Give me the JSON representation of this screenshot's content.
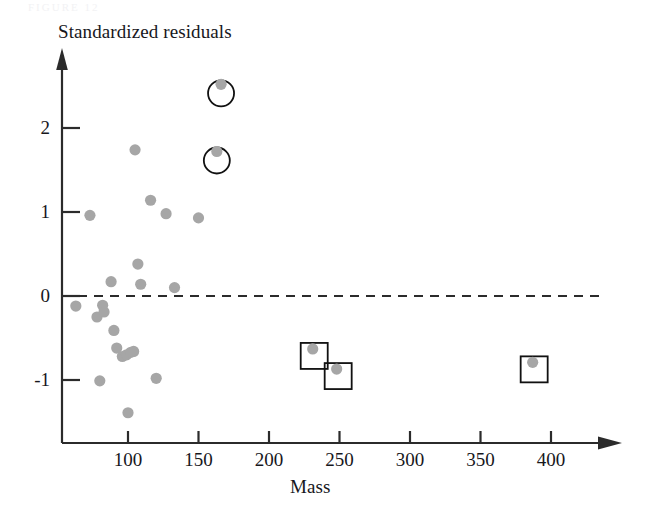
{
  "figure": {
    "ghost_header": "FIGURE 12",
    "y_axis_title": "Standardized residuals",
    "x_axis_title": "Mass"
  },
  "colors": {
    "point_fill": "#a6a6a6",
    "axis": "#2b2b2b",
    "marker_outline": "#111111",
    "text": "#17171c",
    "background": "#ffffff"
  },
  "chart_data": {
    "type": "scatter",
    "title": "",
    "xlabel": "Mass",
    "ylabel": "Standardized residuals",
    "xlim": [
      55,
      420
    ],
    "ylim": [
      -1.55,
      2.85
    ],
    "grid": false,
    "legend": false,
    "reference_line": {
      "orientation": "horizontal",
      "y": 0,
      "style": "dashed"
    },
    "xticks": [
      100,
      150,
      200,
      250,
      300,
      350,
      400
    ],
    "xticklabels": [
      "100",
      "150",
      "200",
      "250",
      "300",
      "350",
      "400"
    ],
    "yticks": [
      2,
      1,
      0,
      -1
    ],
    "yticklabels": [
      "2",
      "1",
      "0",
      "-1"
    ],
    "points": [
      {
        "x": 63,
        "y": -0.12,
        "marker": "none"
      },
      {
        "x": 73,
        "y": 0.96,
        "marker": "none"
      },
      {
        "x": 78,
        "y": -0.25,
        "marker": "none"
      },
      {
        "x": 80,
        "y": -1.01,
        "marker": "none"
      },
      {
        "x": 82,
        "y": -0.11,
        "marker": "none"
      },
      {
        "x": 83,
        "y": -0.19,
        "marker": "none"
      },
      {
        "x": 88,
        "y": 0.17,
        "marker": "none"
      },
      {
        "x": 90,
        "y": -0.41,
        "marker": "none"
      },
      {
        "x": 92,
        "y": -0.62,
        "marker": "none"
      },
      {
        "x": 96,
        "y": -0.72,
        "marker": "none"
      },
      {
        "x": 99,
        "y": -0.7,
        "marker": "none"
      },
      {
        "x": 100,
        "y": -1.39,
        "marker": "none"
      },
      {
        "x": 102,
        "y": -0.67,
        "marker": "none"
      },
      {
        "x": 104,
        "y": -0.66,
        "marker": "none"
      },
      {
        "x": 105,
        "y": 1.74,
        "marker": "none"
      },
      {
        "x": 107,
        "y": 0.38,
        "marker": "none"
      },
      {
        "x": 109,
        "y": 0.14,
        "marker": "none"
      },
      {
        "x": 116,
        "y": 1.14,
        "marker": "none"
      },
      {
        "x": 120,
        "y": -0.98,
        "marker": "none"
      },
      {
        "x": 127,
        "y": 0.98,
        "marker": "none"
      },
      {
        "x": 133,
        "y": 0.1,
        "marker": "none"
      },
      {
        "x": 150,
        "y": 0.93,
        "marker": "none"
      },
      {
        "x": 163,
        "y": 1.72,
        "marker": "circle"
      },
      {
        "x": 166,
        "y": 2.52,
        "marker": "circle"
      },
      {
        "x": 231,
        "y": -0.63,
        "marker": "square"
      },
      {
        "x": 248,
        "y": -0.87,
        "marker": "square"
      },
      {
        "x": 387,
        "y": -0.79,
        "marker": "square"
      }
    ],
    "highlight_notes": {
      "circle": "two high-residual outliers flagged with open circles",
      "square": "three high-leverage points flagged with open squares"
    }
  }
}
